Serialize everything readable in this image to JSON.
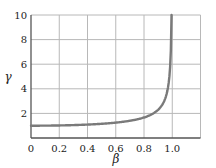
{
  "chart_data": {
    "type": "line",
    "title": "",
    "xlabel": "β",
    "ylabel": "γ",
    "xlim": [
      0,
      1.2
    ],
    "ylim": [
      0,
      10
    ],
    "x_ticks": [
      "0",
      "0.2",
      "0.4",
      "0.6",
      "0.8",
      "1.0"
    ],
    "y_ticks": [
      "2",
      "4",
      "6",
      "8",
      "10"
    ],
    "grid": true,
    "legend": null,
    "series": [
      {
        "name": "γ = 1/√(1−β²)",
        "color": "#7a7a7a",
        "x": [
          0,
          0.1,
          0.2,
          0.3,
          0.4,
          0.5,
          0.6,
          0.7,
          0.8,
          0.85,
          0.9,
          0.93,
          0.95,
          0.97,
          0.98,
          0.99,
          0.995
        ],
        "y": [
          1.0,
          1.005,
          1.021,
          1.048,
          1.091,
          1.155,
          1.25,
          1.4,
          1.667,
          1.898,
          2.294,
          2.721,
          3.203,
          4.113,
          5.025,
          7.089,
          10.0
        ]
      }
    ]
  },
  "colors": {
    "grid": "#b8b8b8",
    "axis": "#555555",
    "curve": "#7a7a7a"
  }
}
